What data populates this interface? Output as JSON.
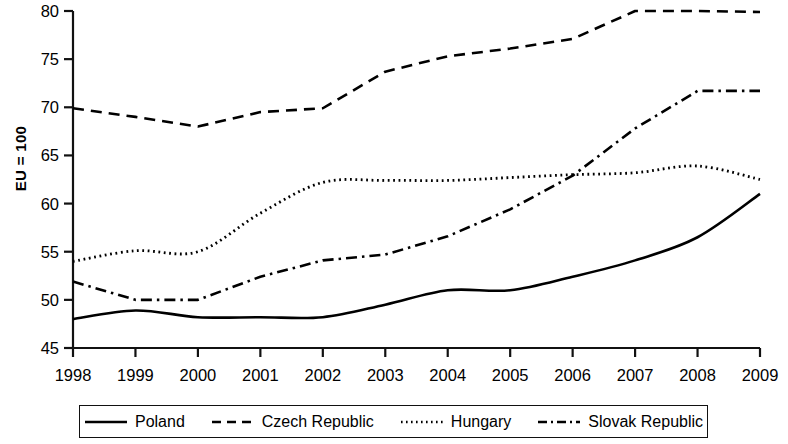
{
  "chart_data": {
    "type": "line",
    "title": "",
    "subtitle": "",
    "xlabel": "",
    "ylabel": "EU = 100",
    "x": [
      1998,
      1999,
      2000,
      2001,
      2002,
      2003,
      2004,
      2005,
      2006,
      2007,
      2008,
      2009
    ],
    "xtick_labels": [
      "1998",
      "1999",
      "2000",
      "2001",
      "2002",
      "2003",
      "2004",
      "2005",
      "2006",
      "2007",
      "2008",
      "2009"
    ],
    "ytick_labels": [
      "45",
      "50",
      "55",
      "60",
      "65",
      "70",
      "75",
      "80"
    ],
    "yticks": [
      45,
      50,
      55,
      60,
      65,
      70,
      75,
      80
    ],
    "xlim": [
      1998,
      2009
    ],
    "ylim": [
      45,
      80
    ],
    "grid": false,
    "legend_position": "bottom",
    "series": [
      {
        "name": "Poland",
        "style": "solid",
        "color": "#000000",
        "values": [
          48.0,
          48.9,
          48.2,
          48.2,
          48.2,
          49.5,
          51.0,
          51.0,
          52.4,
          54.1,
          56.5,
          61.0
        ]
      },
      {
        "name": "Czech Republic",
        "style": "dashed",
        "color": "#000000",
        "values": [
          69.9,
          69.0,
          68.0,
          69.5,
          69.9,
          73.7,
          75.3,
          76.1,
          77.1,
          80.0,
          80.0,
          79.9
        ]
      },
      {
        "name": "Hungary",
        "style": "dotted",
        "color": "#000000",
        "values": [
          54.0,
          55.1,
          55.0,
          59.0,
          62.2,
          62.4,
          62.4,
          62.7,
          63.0,
          63.2,
          63.9,
          62.5
        ]
      },
      {
        "name": "Slovak Republic",
        "style": "dashdot",
        "color": "#000000",
        "values": [
          51.9,
          50.0,
          50.0,
          52.4,
          54.1,
          54.7,
          56.6,
          59.4,
          62.9,
          67.8,
          71.7,
          71.7
        ]
      }
    ]
  },
  "axis": {
    "y_title": "EU = 100"
  },
  "legend": {
    "items": [
      {
        "label": "Poland",
        "style": "solid"
      },
      {
        "label": "Czech Republic",
        "style": "dashed"
      },
      {
        "label": "Hungary",
        "style": "dotted"
      },
      {
        "label": "Slovak Republic",
        "style": "dashdot"
      }
    ]
  }
}
